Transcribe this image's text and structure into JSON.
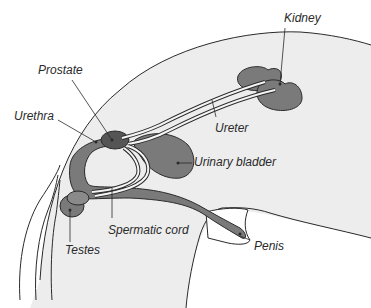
{
  "diagram": {
    "colors": {
      "body_fill": "#ededed",
      "organ_fill": "#7a7a7a",
      "organ_dark": "#555555",
      "outline": "#2a2a2a",
      "background": "#ffffff"
    },
    "labels": {
      "kidney": "Kidney",
      "prostate": "Prostate",
      "urethra": "Urethra",
      "ureter": "Ureter",
      "urinary_bladder": "Urinary bladder",
      "spermatic_cord": "Spermatic cord",
      "testes": "Testes",
      "penis": "Penis"
    }
  }
}
